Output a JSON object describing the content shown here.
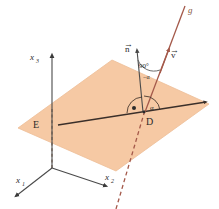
{
  "figure": {
    "kind": "geometry-diagram",
    "colors": {
      "plane_fill": "#F6C9A4",
      "plane_edge": "#E8B68C",
      "line_g": "#A4594A",
      "axis": "#4A4A4A",
      "in_plane_line": "#3A2F2A",
      "vector_n": "#4A4A4A",
      "label_text": "#2B2B2B",
      "background": "#FFFFFF"
    },
    "axes": [
      {
        "id": "x1",
        "base": "x",
        "sub": "1",
        "label": "x1"
      },
      {
        "id": "x2",
        "base": "x",
        "sub": "2",
        "label": "x2"
      },
      {
        "id": "x3",
        "base": "x",
        "sub": "3",
        "label": "x3"
      }
    ],
    "labels": {
      "plane": "E",
      "line": "g",
      "point": "D",
      "normal_vector": "n",
      "direction_vector": "v",
      "angle_alpha": "α",
      "angle_complement": "90°",
      "angle_complement_minus": "−α",
      "vector_arrow": "→"
    }
  }
}
